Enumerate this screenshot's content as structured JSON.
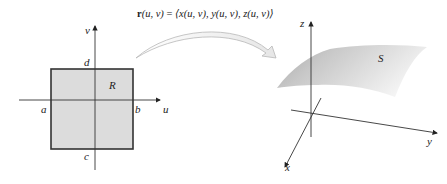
{
  "diagram": {
    "formula": {
      "vector": "r",
      "args": "(u, v)",
      "equals": " = ",
      "rhs": "⟨x(u, v), y(u, v), z(u, v)⟩"
    },
    "domain_plane": {
      "axis_labels": {
        "horizontal": "u",
        "vertical": "v"
      },
      "bounds": {
        "left": "a",
        "right": "b",
        "bottom": "c",
        "top": "d"
      },
      "region_label": "R",
      "region_fill": "#dcdcdc",
      "region_border": "#333333"
    },
    "mapping_arrow": {
      "fill": "#f2f2f2",
      "stroke": "#bbbbbb"
    },
    "space": {
      "axis_labels": {
        "x": "x",
        "y": "y",
        "z": "z"
      },
      "surface_label": "S",
      "surface_fill_dark": "#a8a8a8",
      "surface_fill_light": "#f4f4f4"
    }
  }
}
